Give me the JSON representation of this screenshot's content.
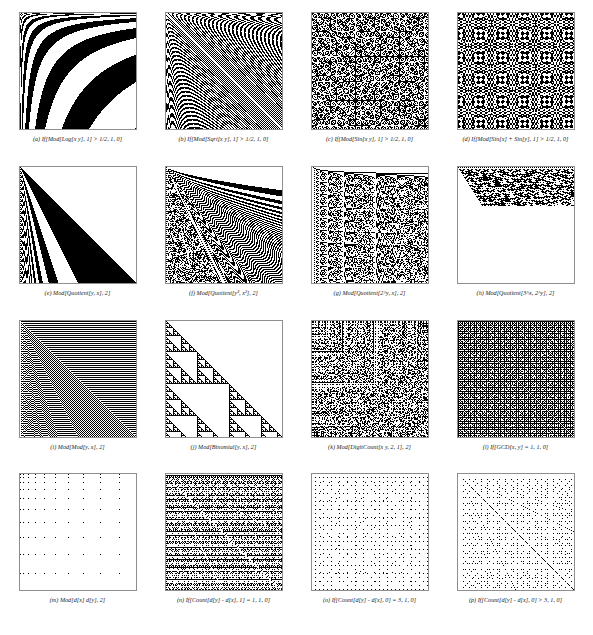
{
  "figure": {
    "title": "",
    "columns": 4,
    "rows": 4,
    "background": "#ffffff",
    "ink_color": "#000000",
    "border_color": "#8e8e8e"
  },
  "panels": [
    {
      "label": "(a)",
      "expression": "If[Mod[Log[x y], 1] > 1/2, 1, 0]",
      "caption": "(a)  If[Mod[Log[x y], 1] > 1/2, 1, 0]",
      "kind": "log-bands"
    },
    {
      "label": "(b)",
      "expression": "If[Mod[Sqrt[x y], 1] > 1/2, 1, 0]",
      "caption": "(b)  If[Mod[Sqrt[x y], 1] > 1/2, 1, 0]",
      "kind": "sqrt-moire"
    },
    {
      "label": "(c)",
      "expression": "If[Mod[Sin[x y], 1] > 1/2, 1, 0]",
      "caption": "(c)  If[Mod[Sin[x y], 1] > 1/2, 1, 0]",
      "kind": "sin-xy"
    },
    {
      "label": "(d)",
      "expression": "If[Mod[Sin[x] + Sin[y], 1] > 1/2, 1, 0]",
      "caption": "(d)  If[Mod[Sin[x] + Sin[y], 1] > 1/2, 1, 0]",
      "kind": "sin-sum"
    },
    {
      "label": "(e)",
      "expression": "Mod[Quotient[y, x], 2]",
      "caption": "(e)  Mod[Quotient[y, x], 2]",
      "kind": "quotient-yx"
    },
    {
      "label": "(f)",
      "expression": "Mod[Quotient[y^3, x^2], 2]",
      "caption": "(f)  Mod[Quotient[y³, x²], 2]",
      "kind": "quotient-pow"
    },
    {
      "label": "(g)",
      "expression": "Mod[Quotient[2^y, x], 2]",
      "caption": "(g)  Mod[Quotient[2^y, x], 2]",
      "kind": "quotient-2y"
    },
    {
      "label": "(h)",
      "expression": "Mod[Quotient[3^x, 2^y], 2]",
      "caption": "(h)  Mod[Quotient[3^x, 2^y], 2]",
      "kind": "quotient-3x2y"
    },
    {
      "label": "(i)",
      "expression": "Mod[Mod[y, x], 2]",
      "caption": "(i)  Mod[Mod[y, x], 2]",
      "kind": "mod-mod"
    },
    {
      "label": "(j)",
      "expression": "Mod[Binomial[y, x], 2]",
      "caption": "(j)  Mod[Binomial[y, x], 2]",
      "kind": "binomial"
    },
    {
      "label": "(k)",
      "expression": "Mod[DigitCount[x y, 2, 1], 2]",
      "caption": "(k)  Mod[DigitCount[x y, 2, 1], 2]",
      "kind": "digitcount"
    },
    {
      "label": "(l)",
      "expression": "If[GCD[x, y] == 1, 1, 0]",
      "caption": "(l)  If[GCD[x, y] = 1, 1, 0]",
      "kind": "gcd"
    },
    {
      "label": "(m)",
      "expression": "Mod[d[x] d[y], 2]",
      "caption": "(m)  Mod[d[x] d[y], 2]",
      "kind": "divisor-prod"
    },
    {
      "label": "(n)",
      "expression": "If[Count[d[y] - d[x], 1] == 1, 1, 0]",
      "caption": "(n)  If[Count[d[y] - d[x], 1] = 1, 1, 0]",
      "kind": "count-eq1"
    },
    {
      "label": "(o)",
      "expression": "If[Count[d[y] - d[x], 0] == 3, 1, 0]",
      "caption": "(o)  If[Count[d[y] - d[x], 0] = 3, 1, 0]",
      "kind": "count-eq3"
    },
    {
      "label": "(p)",
      "expression": "If[Count[d[y] - d[x], 0] > 3, 1, 0]",
      "caption": "(p)  If[Count[d[y] - d[x], 0] > 3, 1, 0]",
      "kind": "count-gt3"
    }
  ]
}
